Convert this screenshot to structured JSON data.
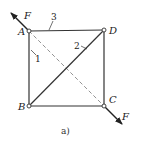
{
  "diagram": {
    "type": "truss",
    "nodes": [
      {
        "id": "A",
        "label": "A",
        "x": 29,
        "y": 31
      },
      {
        "id": "D",
        "label": "D",
        "x": 104,
        "y": 30
      },
      {
        "id": "B",
        "label": "B",
        "x": 29,
        "y": 106
      },
      {
        "id": "C",
        "label": "C",
        "x": 104,
        "y": 106
      }
    ],
    "members": [
      {
        "id": "1",
        "label": "1",
        "from": "A",
        "to": "B"
      },
      {
        "id": "2",
        "label": "2",
        "from": "B",
        "to": "D"
      },
      {
        "id": "3",
        "label": "3",
        "from": "A",
        "to": "D"
      },
      {
        "id": "BC",
        "label": "",
        "from": "B",
        "to": "C"
      },
      {
        "id": "DC",
        "label": "",
        "from": "D",
        "to": "C"
      }
    ],
    "dashed_line": {
      "from": "A",
      "to": "C"
    },
    "forces": [
      {
        "label": "F",
        "at": "A",
        "direction": "up-left"
      },
      {
        "label": "F",
        "at": "C",
        "direction": "down-right"
      }
    ],
    "caption": "a)",
    "colors": {
      "line": "#333333",
      "dashed": "#777777",
      "background": "#ffffff"
    }
  }
}
